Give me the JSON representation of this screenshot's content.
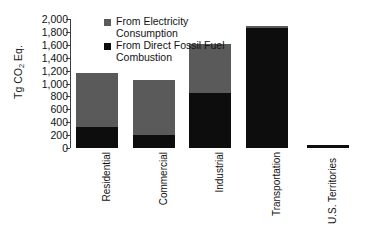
{
  "chart_data": {
    "type": "bar",
    "subtype": "stacked-vertical",
    "title": "",
    "xlabel": "",
    "ylabel": "Tg CO2 Eq.",
    "ylabel_rich": "Tg CO₂ Eq.",
    "ylim": [
      0,
      2000
    ],
    "yticks": [
      0,
      200,
      400,
      600,
      800,
      1000,
      1200,
      1400,
      1600,
      1800,
      2000
    ],
    "ytick_labels": [
      "0",
      "200",
      "400",
      "600",
      "800",
      "1,000",
      "1,200",
      "1,400",
      "1,600",
      "1,800",
      "2,000"
    ],
    "grid": false,
    "legend_position": "top-center",
    "categories": [
      "Residential",
      "Commercial",
      "Industrial",
      "Transportation",
      "U.S. Territories"
    ],
    "series": [
      {
        "name": "From Direct Fossil Fuel Combustion",
        "color": "#0d0d0d",
        "values": [
          330,
          200,
          850,
          1860,
          50
        ]
      },
      {
        "name": "From Electricity Consumption",
        "color": "#5a5a5a",
        "values": [
          840,
          860,
          770,
          25,
          0
        ]
      }
    ],
    "totals": [
      1170,
      1060,
      1620,
      1885,
      50
    ]
  },
  "yaxis": {
    "title_prefix": "Tg CO",
    "title_sub": "2",
    "title_suffix": " Eq.",
    "ticks": [
      {
        "label": "2,000",
        "value": 2000
      },
      {
        "label": "1,800",
        "value": 1800
      },
      {
        "label": "1,600",
        "value": 1600
      },
      {
        "label": "1,400",
        "value": 1400
      },
      {
        "label": "1,200",
        "value": 1200
      },
      {
        "label": "1,000",
        "value": 1000
      },
      {
        "label": "800",
        "value": 800
      },
      {
        "label": "600",
        "value": 600
      },
      {
        "label": "400",
        "value": 400
      },
      {
        "label": "200",
        "value": 200
      },
      {
        "label": "0",
        "value": 0
      }
    ]
  },
  "legend": {
    "items": [
      {
        "label": "From Electricity Consumption",
        "color": "#5a5a5a",
        "icon": "square-swatch-gray"
      },
      {
        "label": "From Direct Fossil Fuel Combustion",
        "color": "#0d0d0d",
        "icon": "square-swatch-black"
      }
    ]
  },
  "categories": [
    {
      "label": "Residential",
      "multiline": false
    },
    {
      "label": "Commercial",
      "multiline": false
    },
    {
      "label": "Industrial",
      "multiline": false
    },
    {
      "label": "Transportation",
      "multiline": false
    },
    {
      "label": "U.S. Territories",
      "multiline": true
    }
  ],
  "colors": {
    "electricity": "#5a5a5a",
    "fossil": "#0d0d0d",
    "axis": "#3d3d3d",
    "text": "#111111",
    "background": "#ffffff"
  }
}
